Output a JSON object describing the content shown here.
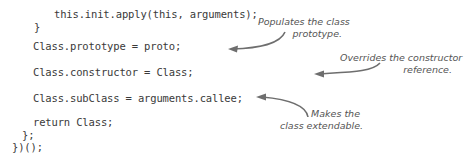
{
  "code": {
    "lines": [
      "this.init.apply(this, arguments);",
      "}",
      "Class.prototype = proto;",
      "Class.constructor = Class;",
      "Class.subClass = arguments.callee;",
      "return Class;",
      "};",
      "})();"
    ]
  },
  "annotations": [
    {
      "line1": "Populates the class",
      "line2": "prototype."
    },
    {
      "line1": "Overrides the constructor",
      "line2": "reference."
    },
    {
      "line1": "Makes the",
      "line2": "class extendable."
    }
  ],
  "colors": {
    "text": "#3a3a3a",
    "annotation": "#555555",
    "arrow": "#6e6e6e"
  }
}
